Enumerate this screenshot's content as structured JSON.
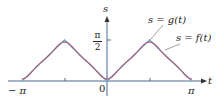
{
  "chart_data": {
    "type": "line",
    "title": "",
    "xlabel": "t",
    "ylabel": "s",
    "xlim": [
      -3.1416,
      3.1416
    ],
    "ylim": [
      0,
      1.5708
    ],
    "x_ticks": [
      {
        "value": -3.1416,
        "label": "−π"
      },
      {
        "value": -1.5708,
        "label": ""
      },
      {
        "value": 0,
        "label": "0"
      },
      {
        "value": 1.5708,
        "label": ""
      },
      {
        "value": 3.1416,
        "label": "π"
      }
    ],
    "y_ticks": [
      {
        "value": 1.5708,
        "label": "π/2"
      }
    ],
    "grid": false,
    "series": [
      {
        "name": "s = f(t)",
        "description": "triangle wave |t| reflected, peaks π/2 at t = ±π/2",
        "color": "#5fb3d9",
        "x": [
          -3.1416,
          -1.5708,
          0,
          1.5708,
          3.1416
        ],
        "values": [
          0,
          1.5708,
          0,
          1.5708,
          0
        ]
      },
      {
        "name": "s = g(t)",
        "description": "smooth Fourier approximation of f",
        "color": "#d9607a",
        "x": [
          -3.1416,
          -2.3562,
          -1.5708,
          -0.7854,
          0,
          0.7854,
          1.5708,
          2.3562,
          3.1416
        ],
        "values": [
          0.02,
          0.8,
          1.5,
          0.8,
          0.02,
          0.8,
          1.5,
          0.8,
          0.02
        ]
      }
    ],
    "annotations": [
      {
        "text": "s = g(t)",
        "points_to": "g"
      },
      {
        "text": "s = f(t)",
        "points_to": "f"
      }
    ]
  },
  "labels": {
    "s_axis": "s",
    "t_axis": "t",
    "pi_num": "π",
    "pi_den": "2",
    "neg_pi": "− π",
    "zero": "0",
    "pos_pi": "π",
    "g_label": "s = g(t)",
    "f_label": "s = f(t)"
  },
  "colors": {
    "axis": "#4a6a8a",
    "f": "#5fb3d9",
    "g": "#d9607a",
    "leader": "#777777"
  }
}
